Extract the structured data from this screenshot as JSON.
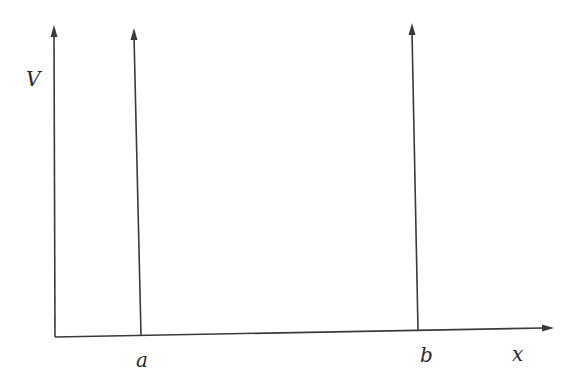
{
  "diagram": {
    "type": "potential-axes-with-vertical-walls",
    "labels": {
      "y_axis": "V",
      "x_axis": "x",
      "wall_a": "a",
      "wall_b": "b"
    },
    "colors": {
      "line": "#3a3a3a",
      "background": "#ffffff"
    },
    "elements": [
      {
        "name": "y-axis",
        "kind": "arrow-up",
        "x": 55
      },
      {
        "name": "wall-a",
        "kind": "arrow-up",
        "x": 141
      },
      {
        "name": "wall-b",
        "kind": "arrow-up",
        "x": 412
      },
      {
        "name": "x-axis",
        "kind": "arrow-right"
      }
    ]
  }
}
